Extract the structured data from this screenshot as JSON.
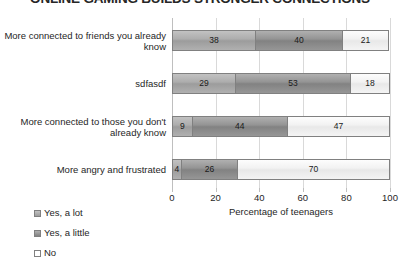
{
  "chart_data": {
    "type": "bar",
    "orientation": "horizontal",
    "stacked": true,
    "title": "ONLINE GAMING BUILDS STRONGER CONNECTIONS",
    "xlabel": "Percentage of teenagers",
    "ylabel": "",
    "xlim": [
      0,
      100
    ],
    "xticks": [
      "0",
      "20",
      "40",
      "60",
      "80",
      "100"
    ],
    "grid": true,
    "legend_position": "bottom-left",
    "categories": [
      "More connected to friends you already know",
      "sdfasdf",
      "More connected to those you don't already know",
      "More angry and frustrated"
    ],
    "series": [
      {
        "name": "Yes, a lot",
        "values": [
          38,
          29,
          9,
          4
        ],
        "color": "#a6a6a6"
      },
      {
        "name": "Yes, a little",
        "values": [
          40,
          53,
          44,
          26
        ],
        "color": "#8c8c8c"
      },
      {
        "name": "No",
        "values": [
          21,
          18,
          47,
          70
        ],
        "color": "#f2f2f2"
      }
    ]
  },
  "legend": {
    "items": [
      {
        "label": "Yes, a lot"
      },
      {
        "label": "Yes, a little"
      },
      {
        "label": "No"
      }
    ]
  }
}
